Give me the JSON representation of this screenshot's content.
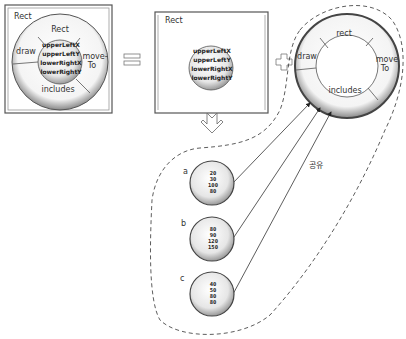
{
  "diagram": {
    "left_box": {
      "title": "Rect",
      "ring_segments": {
        "top": "Rect",
        "left": "draw",
        "right_line1": "move-",
        "right_line2": "To",
        "bottom": "includes"
      },
      "core_fields": [
        "upperLeftX",
        "upperLeftY",
        "lowerRightX",
        "lowerRightY"
      ]
    },
    "equals_symbol": "equals-icon",
    "middle_box": {
      "title": "Rect",
      "core_fields": [
        "upperLeftX",
        "upperLeftY",
        "lowerRightX",
        "lowerRightY"
      ]
    },
    "plus_symbol": "plus-icon",
    "shared_ring": {
      "segments": {
        "top": "rect",
        "left": "draw",
        "right_line1": "move",
        "right_line2": "To",
        "bottom": "includes"
      }
    },
    "down_arrow": "down-arrow-icon",
    "share_label": "공유",
    "instances": [
      {
        "label": "a",
        "values": [
          "20",
          "30",
          "100",
          "80"
        ]
      },
      {
        "label": "b",
        "values": [
          "80",
          "90",
          "120",
          "150"
        ]
      },
      {
        "label": "c",
        "values": [
          "40",
          "50",
          "80",
          "80"
        ]
      }
    ]
  }
}
